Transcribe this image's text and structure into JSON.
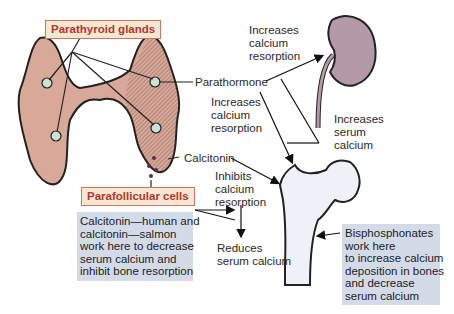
{
  "labels": {
    "parathyroid_glands": "Parathyroid glands",
    "parafollicular_cells": "Parafollicular cells",
    "parathormone": "Parathormone",
    "calcitonin": "Calcitonin",
    "kidney_effect": "Increases\ncalcium\nresorption",
    "bone_effect_pth": "Increases\ncalcium\nresorption",
    "serum_effect": "Increases\nserum\ncalcium",
    "calcitonin_effect": "Inhibits\ncalcium\nresorption",
    "reduces": "Reduces\nserum calcium"
  },
  "notes": {
    "calcitonin_drugs": "Calcitonin—human and\ncalcitonin—salmon\nwork here to decrease\nserum calcium and\ninhibit bone resorption",
    "bisphosphonates": "Bisphosphonates\nwork here\nto increase calcium\ndeposition in bones\nand decrease\nserum calcium"
  },
  "colors": {
    "thyroid": "#d8a899",
    "gland": "#c9e3d6",
    "kidney": "#b49aa8",
    "bone": "#eef1f8",
    "tag_bg": "#f6e6d4",
    "tag_text": "#b3372a",
    "note_bg": "#d4dbe8"
  }
}
